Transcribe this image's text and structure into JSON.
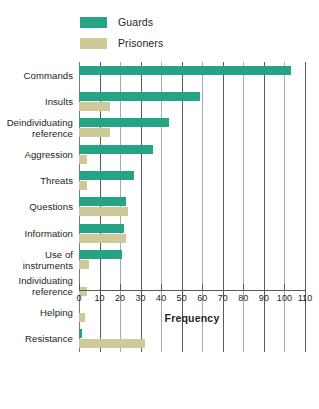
{
  "chart_data": {
    "type": "bar",
    "orientation": "horizontal",
    "title": "",
    "xlabel": "Frequency",
    "ylabel": "",
    "xlim": [
      0,
      110
    ],
    "xticks": [
      0,
      10,
      20,
      30,
      40,
      50,
      60,
      70,
      80,
      90,
      100,
      110
    ],
    "grid": true,
    "legend_position": "top-left",
    "categories": [
      "Commands",
      "Insults",
      "Deindividuating\nreference",
      "Aggression",
      "Threats",
      "Questions",
      "Information",
      "Use of\ninstruments",
      "Individuating\nreference",
      "Helping",
      "Resistance"
    ],
    "series": [
      {
        "name": "Guards",
        "color": "#26a384",
        "values": [
          103,
          59,
          44,
          36,
          27,
          23,
          22,
          21,
          0,
          0,
          1.5
        ]
      },
      {
        "name": "Prisoners",
        "color": "#cfc999",
        "values": [
          0,
          15,
          15,
          4,
          4,
          24,
          23,
          5,
          4,
          3,
          32
        ]
      }
    ]
  },
  "legend": {
    "items": [
      {
        "label": "Guards",
        "color": "#26a384"
      },
      {
        "label": "Prisoners",
        "color": "#cfc999"
      }
    ]
  },
  "axis": {
    "x_title": "Frequency",
    "tick_labels": [
      "0",
      "10",
      "20",
      "30",
      "40",
      "50",
      "60",
      "70",
      "80",
      "90",
      "100",
      "110"
    ]
  }
}
